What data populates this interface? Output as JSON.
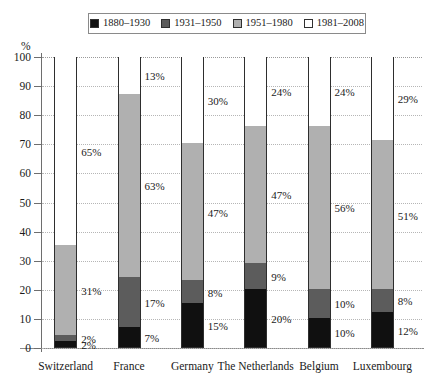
{
  "chart_data": {
    "type": "bar",
    "subtype": "stacked-bar-100",
    "title": "",
    "xlabel": "",
    "ylabel": "%",
    "ylim": [
      0,
      100
    ],
    "yticks": [
      0,
      10,
      20,
      30,
      40,
      50,
      60,
      70,
      80,
      90,
      100
    ],
    "grid": true,
    "legend_position": "top-center",
    "categories": [
      "Switzerland",
      "France",
      "Germany",
      "The Netherlands",
      "Belgium",
      "Luxembourg"
    ],
    "series": [
      {
        "name": "1880–1930",
        "color": "#101010",
        "values": [
          2,
          7,
          15,
          20,
          10,
          12
        ],
        "labels": [
          "2%",
          "7%",
          "15%",
          "20%",
          "10%",
          "12%"
        ]
      },
      {
        "name": "1931–1950",
        "color": "#5c5c5c",
        "values": [
          2,
          17,
          8,
          9,
          10,
          8
        ],
        "labels": [
          "2%",
          "17%",
          "8%",
          "9%",
          "10%",
          "8%"
        ]
      },
      {
        "name": "1951–1980",
        "color": "#b0b0b0",
        "values": [
          31,
          63,
          47,
          47,
          56,
          51
        ],
        "labels": [
          "31%",
          "63%",
          "47%",
          "47%",
          "56%",
          "51%"
        ]
      },
      {
        "name": "1981–2008",
        "color": "#ffffff",
        "values": [
          65,
          13,
          30,
          24,
          24,
          29
        ],
        "labels": [
          "65%",
          "13%",
          "30%",
          "24%",
          "24%",
          "29%"
        ]
      }
    ]
  },
  "axis": {
    "y_title": "%",
    "y_tick_labels": [
      "0",
      "10",
      "20",
      "30",
      "40",
      "50",
      "60",
      "70",
      "80",
      "90",
      "100"
    ]
  },
  "legend": {
    "items": [
      {
        "label": "1880–1930",
        "color": "#101010"
      },
      {
        "label": "1931–1950",
        "color": "#5c5c5c"
      },
      {
        "label": "1951–1980",
        "color": "#b0b0b0"
      },
      {
        "label": "1981–2008",
        "color": "#ffffff"
      }
    ]
  }
}
